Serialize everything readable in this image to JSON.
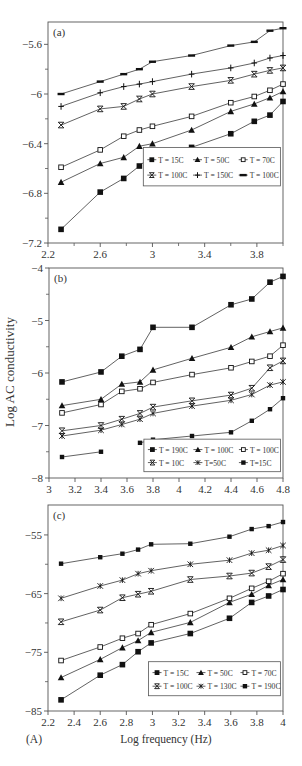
{
  "figure": {
    "corner_label": "(A)",
    "shared_ylabel": "Log AC conductivity",
    "shared_xlabel": "Log frequency (Hz)",
    "colors": {
      "line": "#3a3a3a",
      "marker": "#111111",
      "frame": "#555555",
      "text": "#333333"
    }
  },
  "chart_data": [
    {
      "panel": "(a)",
      "type": "line",
      "title": "",
      "xlabel": "",
      "ylabel": "",
      "xlim": [
        2.2,
        4.0
      ],
      "ylim": [
        -7.2,
        -5.42
      ],
      "xticks": [
        2.2,
        2.6,
        3.0,
        3.4,
        3.8
      ],
      "xtick_labels": [
        "2.2",
        "2.6",
        "3",
        "3.4",
        "3.8"
      ],
      "xminor": [
        2.4,
        2.8,
        3.2,
        3.6,
        4.0
      ],
      "yticks": [
        -5.6,
        -6.0,
        -6.4,
        -6.8,
        -7.2
      ],
      "ytick_labels": [
        "-5.6",
        "-6",
        "-6.4",
        "-6.8",
        "-7.2"
      ],
      "yminor": [
        -5.8,
        -6.2,
        -6.6,
        -7.0
      ],
      "grid": false,
      "legend_position": "lower right (inside)",
      "legend_box": {
        "x": 2.93,
        "y": -6.74,
        "w": 1.05,
        "h": 0.31
      },
      "x": [
        2.3,
        2.6,
        2.78,
        2.9,
        3.0,
        3.3,
        3.6,
        3.78,
        3.9,
        4.0
      ],
      "series": [
        {
          "name": "T = 15C",
          "marker": "square",
          "values": [
            -7.09,
            -6.79,
            -6.68,
            -6.58,
            -6.49,
            -6.43,
            -6.32,
            -6.22,
            -6.17,
            -6.06
          ]
        },
        {
          "name": "T = 50C",
          "marker": "triangle",
          "values": [
            -6.71,
            -6.56,
            -6.51,
            -6.42,
            -6.4,
            -6.29,
            -6.14,
            -6.08,
            -6.03,
            -5.98
          ]
        },
        {
          "name": "T = 70C",
          "marker": "open-square",
          "values": [
            -6.59,
            -6.45,
            -6.34,
            -6.29,
            -6.26,
            -6.18,
            -6.07,
            -6.02,
            -5.97,
            -5.92
          ]
        },
        {
          "name": "T = 100C",
          "marker": "x-bar",
          "values": [
            -6.25,
            -6.12,
            -6.1,
            -6.04,
            -6.0,
            -5.94,
            -5.89,
            -5.84,
            -5.81,
            -5.79
          ]
        },
        {
          "name": "T = 150C",
          "marker": "plus",
          "values": [
            -6.1,
            -5.99,
            -5.94,
            -5.92,
            -5.9,
            -5.84,
            -5.79,
            -5.75,
            -5.71,
            -5.69
          ]
        },
        {
          "name": "T = 100C",
          "marker": "dash",
          "values": [
            -6.0,
            -5.9,
            -5.84,
            -5.8,
            -5.74,
            -5.69,
            -5.61,
            -5.58,
            -5.49,
            -5.47
          ]
        }
      ]
    },
    {
      "panel": "(b)",
      "type": "line",
      "title": "",
      "xlabel": "",
      "ylabel": "Log AC conductivity",
      "xlim": [
        3.0,
        4.8
      ],
      "ylim": [
        -8.0,
        -4.0
      ],
      "xticks": [
        3.0,
        3.2,
        3.4,
        3.6,
        3.8,
        4.0,
        4.2,
        4.4,
        4.6,
        4.8
      ],
      "xtick_labels": [
        "3",
        "3.2",
        "3.4",
        "3.6",
        "3.8",
        "4",
        "4.2",
        "4.4",
        "4.6",
        "4.8"
      ],
      "xminor": [],
      "yticks": [
        -4,
        -5,
        -6,
        -7,
        -8
      ],
      "ytick_labels": [
        "-4",
        "-5",
        "-6",
        "-7",
        "-8"
      ],
      "yminor": [
        -4.5,
        -5.5,
        -6.5,
        -7.5
      ],
      "grid": false,
      "legend_position": "lower right (inside)",
      "legend_box": {
        "x": 3.73,
        "y": -7.88,
        "w": 1.05,
        "h": 0.62
      },
      "x": [
        3.1,
        3.4,
        3.56,
        3.7,
        3.8,
        4.1,
        4.4,
        4.56,
        4.7,
        4.8
      ],
      "series": [
        {
          "name": "T = 190C",
          "marker": "square",
          "values": [
            -6.17,
            -5.98,
            -5.68,
            -5.55,
            -5.13,
            -5.13,
            -4.7,
            -4.59,
            -4.27,
            -4.16
          ]
        },
        {
          "name": "T = 100C",
          "marker": "triangle",
          "values": [
            -6.62,
            -6.5,
            -6.21,
            -6.17,
            -5.94,
            -5.72,
            -5.51,
            -5.31,
            -5.21,
            -5.14
          ]
        },
        {
          "name": "T = 100C",
          "marker": "open-square",
          "values": [
            -6.76,
            -6.6,
            -6.35,
            -6.3,
            -6.18,
            -6.03,
            -5.9,
            -5.78,
            -5.68,
            -5.47
          ]
        },
        {
          "name": "T = 10C",
          "marker": "x-bar",
          "values": [
            -7.1,
            -7.0,
            -6.88,
            -6.77,
            -6.65,
            -6.53,
            -6.42,
            -6.29,
            -5.9,
            -5.77
          ]
        },
        {
          "name": "T=50C",
          "marker": "asterisk",
          "values": [
            -7.2,
            -7.09,
            -6.98,
            -6.88,
            -6.77,
            -6.63,
            -6.52,
            -6.41,
            -6.23,
            -6.17
          ]
        },
        {
          "name": "T=15C",
          "marker": "small-square",
          "values": [
            -7.6,
            -7.5,
            null,
            -7.33,
            -7.27,
            -7.2,
            -7.13,
            -6.91,
            -6.69,
            -6.48
          ]
        }
      ]
    },
    {
      "panel": "(c)",
      "type": "line",
      "title": "",
      "xlabel": "Log frequency (Hz)",
      "ylabel": "",
      "xlim": [
        2.2,
        4.0
      ],
      "ylim": [
        -85,
        -49.9
      ],
      "xticks": [
        2.2,
        2.4,
        2.6,
        2.8,
        3.0,
        3.2,
        3.4,
        3.6,
        3.8,
        4.0
      ],
      "xtick_labels": [
        "2.2",
        "2.4",
        "2.6",
        "2.8",
        "3",
        "3.2",
        "3.4",
        "3.6",
        "3.8",
        "4"
      ],
      "xminor": [],
      "yticks": [
        -55,
        -65,
        -75,
        -85
      ],
      "ytick_labels": [
        "-55",
        "-65",
        "-75",
        "-85"
      ],
      "yminor": [
        -60,
        -70,
        -80
      ],
      "grid": false,
      "legend_position": "lower right (inside)",
      "legend_box": {
        "x": 2.97,
        "y": -82.4,
        "w": 1.01,
        "h": 5.8
      },
      "x": [
        2.3,
        2.6,
        2.77,
        2.89,
        2.99,
        3.29,
        3.59,
        3.76,
        3.89,
        4.0
      ],
      "series": [
        {
          "name": "T = 15C",
          "marker": "square",
          "values": [
            -83.1,
            -78.9,
            -77.1,
            -74.9,
            -73.4,
            -71.8,
            -69.2,
            -66.5,
            -65.4,
            -64.3
          ]
        },
        {
          "name": "T = 50C",
          "marker": "triangle",
          "values": [
            -79.3,
            -76.2,
            -74.2,
            -73.0,
            -71.6,
            -69.9,
            -66.5,
            -65.1,
            -63.6,
            -62.6
          ]
        },
        {
          "name": "T = 70C",
          "marker": "open-square",
          "values": [
            -76.4,
            -74.1,
            -72.6,
            -71.8,
            -70.3,
            -68.4,
            -65.8,
            -64.1,
            -62.9,
            -61.6
          ]
        },
        {
          "name": "T = 100C",
          "marker": "x-bar",
          "values": [
            -69.8,
            -67.8,
            -65.7,
            -65.1,
            -64.6,
            -62.6,
            -62.0,
            -61.5,
            -60.4,
            -59.2
          ]
        },
        {
          "name": "T = 130C",
          "marker": "asterisk",
          "values": [
            -65.8,
            -63.7,
            -62.7,
            -61.6,
            -61.1,
            -60.0,
            -59.3,
            -58.1,
            -57.6,
            -56.8
          ]
        },
        {
          "name": "T = 190C",
          "marker": "small-square",
          "values": [
            -59.9,
            -58.8,
            -58.2,
            -57.5,
            -56.6,
            -56.5,
            -55.3,
            -54.0,
            -53.5,
            -52.8
          ]
        }
      ]
    }
  ],
  "layout": {
    "panels": [
      {
        "left": 48,
        "top": 22,
        "right": 283,
        "bottom": 243
      },
      {
        "left": 49,
        "top": 268,
        "right": 283,
        "bottom": 478
      },
      {
        "left": 48,
        "top": 505,
        "right": 283,
        "bottom": 711
      }
    ]
  }
}
